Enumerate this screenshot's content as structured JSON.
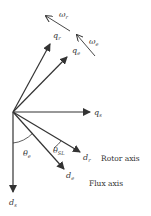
{
  "diagram": {
    "axes": {
      "ds": {
        "label": "d",
        "sub": "s"
      },
      "qs": {
        "label": "q",
        "sub": "s"
      },
      "dr": {
        "label": "d",
        "sub": "r",
        "caption": "Rotor axis"
      },
      "de": {
        "label": "d",
        "sub": "e",
        "caption": "Flux axis"
      },
      "qr": {
        "label": "q",
        "sub": "r"
      },
      "qe": {
        "label": "q",
        "sub": "e"
      }
    },
    "angles": {
      "theta_e": {
        "label": "θ",
        "sub": "e"
      },
      "theta_sl": {
        "label": "θ",
        "sub": "SL"
      }
    },
    "rotations": {
      "omega_r": {
        "label": "ω",
        "sub": "r"
      },
      "omega_e": {
        "label": "ω",
        "sub": "e"
      }
    },
    "colors": {
      "line": "#333333",
      "background": "#ffffff"
    }
  }
}
